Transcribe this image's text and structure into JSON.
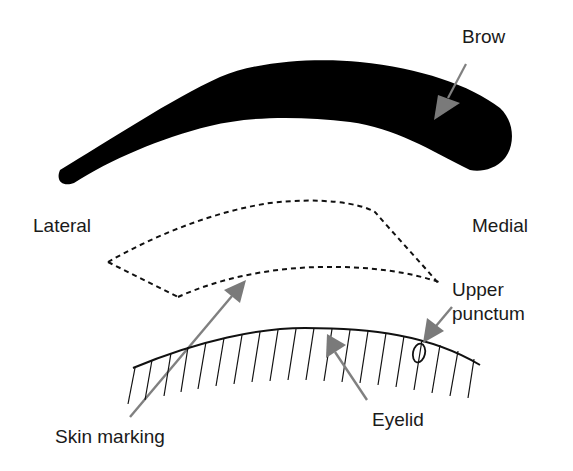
{
  "diagram": {
    "colors": {
      "brow_fill": "#000000",
      "arrow": "#808080",
      "line": "#111111",
      "text": "#1a1a1a",
      "background": "#ffffff"
    },
    "labels": {
      "brow": "Brow",
      "lateral": "Lateral",
      "medial": "Medial",
      "upper_punctum_line1": "Upper",
      "upper_punctum_line2": "punctum",
      "eyelid": "Eyelid",
      "skin_marking": "Skin marking"
    },
    "orientation": {
      "left_side": "Lateral",
      "right_side": "Medial"
    },
    "elements": [
      {
        "name": "brow",
        "type": "filled-shape",
        "label": "Brow"
      },
      {
        "name": "skin-marking-outline",
        "type": "dashed-outline",
        "label": "Skin marking"
      },
      {
        "name": "eyelid-margin",
        "type": "hatched-curve",
        "label": "Eyelid"
      },
      {
        "name": "upper-punctum",
        "type": "oval",
        "label": "Upper punctum"
      }
    ]
  }
}
